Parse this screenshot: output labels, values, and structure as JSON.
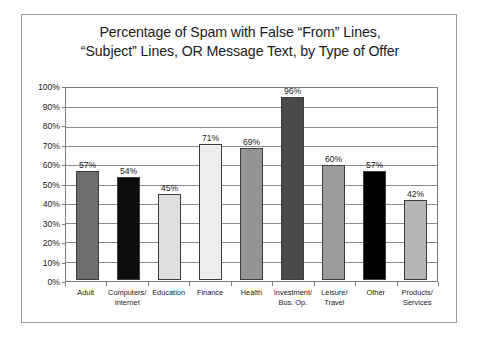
{
  "chart_data": {
    "type": "bar",
    "title": "Percentage of Spam with False “From” Lines, “Subject” Lines, OR Message Text, by Type of Offer",
    "title_lines": [
      "Percentage of Spam with False “From” Lines,",
      "“Subject” Lines, OR Message Text, by Type of Offer"
    ],
    "xlabel": "",
    "ylabel": "",
    "ylim": [
      0,
      100
    ],
    "ytick_step": 10,
    "grid": true,
    "legend": false,
    "categories": [
      "Adult",
      "Computers/ Internet",
      "Education",
      "Finance",
      "Health",
      "Investment/ Bus. Op.",
      "Leisure/ Travel",
      "Other",
      "Products/ Services"
    ],
    "category_lines": [
      [
        "Adult",
        ""
      ],
      [
        "Computers/",
        "Internet"
      ],
      [
        "Education",
        ""
      ],
      [
        "Finance",
        ""
      ],
      [
        "Health",
        ""
      ],
      [
        "Investment/",
        "Bus. Op."
      ],
      [
        "Leisure/",
        "Travel"
      ],
      [
        "Other",
        ""
      ],
      [
        "Products/",
        "Services"
      ]
    ],
    "values": [
      57,
      54,
      45,
      71,
      69,
      96,
      60,
      57,
      42
    ],
    "value_labels": [
      "57%",
      "54%",
      "45%",
      "71%",
      "69%",
      "96%",
      "60%",
      "57%",
      "42%"
    ],
    "bar_colors": [
      "#6e6e6e",
      "#0d0d0d",
      "#dedede",
      "#ededed",
      "#949494",
      "#4a4a4a",
      "#9b9b9b",
      "#000000",
      "#b5b5b5"
    ],
    "ytick_labels": [
      "100%",
      "90%",
      "80%",
      "70%",
      "60%",
      "50%",
      "40%",
      "30%",
      "20%",
      "10%",
      "0%"
    ],
    "ytick_values": [
      100,
      90,
      80,
      70,
      60,
      50,
      40,
      30,
      20,
      10,
      0
    ]
  },
  "style": {
    "frame_border": "#9a9a9a",
    "axis_color": "#7d7d7d",
    "grid_color": "#8c8c8c",
    "bar_outline": "#3d3d3d",
    "text_color": "#1a1a1a",
    "background": "#ffffff"
  }
}
